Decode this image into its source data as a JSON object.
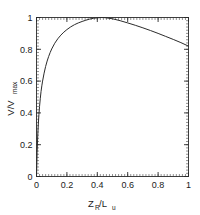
{
  "chart_data": {
    "type": "line",
    "title": "",
    "subtitle": "",
    "xlabel": "Z_R/L_u",
    "xlabel_main": "Z",
    "xlabel_sub1": "R",
    "xlabel_slash": "/L",
    "xlabel_sub2": "u",
    "ylabel": "V/V_max",
    "ylabel_main": "V/V",
    "ylabel_sub": "max",
    "xlim": [
      0,
      1
    ],
    "ylim": [
      0,
      1
    ],
    "xticks": [
      0,
      0.2,
      0.4,
      0.6,
      0.8,
      1
    ],
    "yticks": [
      0,
      0.2,
      0.4,
      0.6,
      0.8,
      1
    ],
    "xticklabels": [
      "0",
      "0.2",
      "0.4",
      "0.6",
      "0.8",
      "1"
    ],
    "yticklabels": [
      "0",
      "0.2",
      "0.4",
      "0.6",
      "0.8",
      "1"
    ],
    "x_minor_count": 50,
    "y_minor_count": 50,
    "grid": false,
    "legend": null,
    "legend_position": "none",
    "curve_color": "#2b2b2b",
    "frame_color": "#2a2a2a",
    "background_color": "#ffffff",
    "series": [
      {
        "name": "V/Vmax",
        "x": [
          0.0,
          0.004,
          0.008,
          0.012,
          0.016,
          0.02,
          0.025,
          0.03,
          0.035,
          0.04,
          0.05,
          0.06,
          0.07,
          0.08,
          0.09,
          0.1,
          0.12,
          0.14,
          0.16,
          0.18,
          0.2,
          0.225,
          0.25,
          0.275,
          0.3,
          0.325,
          0.35,
          0.375,
          0.4,
          0.425,
          0.45,
          0.5,
          0.55,
          0.6,
          0.65,
          0.7,
          0.75,
          0.8,
          0.85,
          0.9,
          0.95,
          1.0
        ],
        "y": [
          0.0,
          0.15,
          0.255,
          0.33,
          0.39,
          0.44,
          0.492,
          0.535,
          0.57,
          0.6,
          0.65,
          0.692,
          0.726,
          0.755,
          0.78,
          0.802,
          0.838,
          0.866,
          0.889,
          0.908,
          0.924,
          0.941,
          0.955,
          0.966,
          0.975,
          0.983,
          0.99,
          0.995,
          0.998,
          1.0,
          0.999,
          0.992,
          0.98,
          0.966,
          0.951,
          0.935,
          0.918,
          0.9,
          0.881,
          0.862,
          0.842,
          0.82
        ]
      }
    ]
  }
}
